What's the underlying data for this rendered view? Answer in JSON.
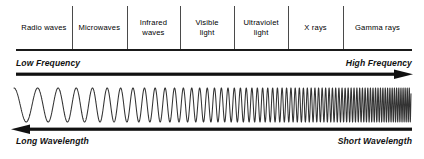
{
  "diagram": {
    "background_color": "#ffffff",
    "line_color": "#1a1a1a",
    "divider_color": "#4a4a4a",
    "wave_color": "#333333"
  },
  "spectrum": {
    "bands": [
      {
        "label": "Radio waves",
        "start_pct": 0.0,
        "end_pct": 14.1
      },
      {
        "label": "Microwaves",
        "start_pct": 14.1,
        "end_pct": 28.0
      },
      {
        "label": "Infrared\nwaves",
        "start_pct": 28.0,
        "end_pct": 41.4
      },
      {
        "label": "Visible\nlight",
        "start_pct": 41.4,
        "end_pct": 55.1
      },
      {
        "label": "Ultraviolet\nlight",
        "start_pct": 55.1,
        "end_pct": 68.7
      },
      {
        "label": "X rays",
        "start_pct": 68.7,
        "end_pct": 82.6
      },
      {
        "label": "Gamma rays",
        "start_pct": 82.6,
        "end_pct": 100.0
      }
    ]
  },
  "frequency_axis": {
    "left_label": "Low Frequency",
    "right_label": "High Frequency",
    "direction": "left-to-right",
    "arrow_icon": "arrow-right-icon"
  },
  "wavelength_axis": {
    "left_label": "Long Wavelength",
    "right_label": "Short Wavelength",
    "direction": "right-to-left",
    "arrow_icon": "arrow-left-icon"
  },
  "chart_data": {
    "type": "line",
    "xlabel": "",
    "ylabel": "",
    "categories": [
      "Radio waves",
      "Microwaves",
      "Infrared waves",
      "Visible light",
      "Ultraviolet light",
      "X rays",
      "Gamma rays"
    ],
    "band_boundaries_pct": [
      0.0,
      14.1,
      28.0,
      41.4,
      55.1,
      68.7,
      82.6,
      100.0
    ],
    "series": [
      {
        "name": "Waveform",
        "description": "Sinusoid whose frequency increases exponentially from left to right",
        "start_x_px": 14,
        "end_x_px": 411,
        "amplitude_px": 17,
        "center_y_px": 105,
        "start_period_px": 25.5,
        "end_period_px": 2.0
      }
    ],
    "annotations": [
      {
        "text": "Low Frequency",
        "position": "upper-left"
      },
      {
        "text": "High Frequency",
        "position": "upper-right"
      },
      {
        "text": "Long Wavelength",
        "position": "lower-left"
      },
      {
        "text": "Short Wavelength",
        "position": "lower-right"
      }
    ],
    "grid": false,
    "legend": "none"
  }
}
